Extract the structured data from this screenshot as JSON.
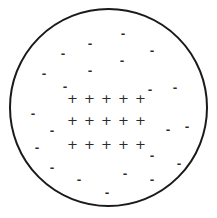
{
  "diagram": {
    "title": "",
    "circle": {
      "stroke": "#1a1a1a",
      "fill": "#ffffff"
    },
    "plus_symbol": "+",
    "minus_symbol": "-",
    "plus_rows": [
      {
        "label": "+ + + + +",
        "y": 98
      },
      {
        "label": "+ + + + +",
        "y": 120
      },
      {
        "label": "+ + + + +",
        "y": 144
      }
    ],
    "minus_positions": [
      [
        123,
        33
      ],
      [
        90,
        43
      ],
      [
        63,
        53
      ],
      [
        152,
        50
      ],
      [
        122,
        60
      ],
      [
        90,
        70
      ],
      [
        44,
        73
      ],
      [
        65,
        86
      ],
      [
        150,
        89
      ],
      [
        175,
        87
      ],
      [
        33,
        113
      ],
      [
        52,
        130
      ],
      [
        168,
        129
      ],
      [
        187,
        126
      ],
      [
        37,
        147
      ],
      [
        152,
        155
      ],
      [
        52,
        167
      ],
      [
        179,
        163
      ],
      [
        125,
        173
      ],
      [
        79,
        179
      ],
      [
        152,
        179
      ],
      [
        107,
        192
      ]
    ]
  }
}
